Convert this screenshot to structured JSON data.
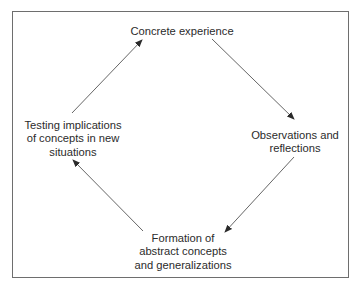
{
  "diagram": {
    "type": "cycle",
    "direction": "clockwise",
    "nodes": {
      "top": {
        "lines": [
          "Concrete experience"
        ]
      },
      "right": {
        "lines": [
          "Observations and",
          "reflections"
        ]
      },
      "bottom": {
        "lines": [
          "Formation of",
          "abstract concepts",
          "and generalizations"
        ]
      },
      "left": {
        "lines": [
          "Testing implications",
          "of concepts in new",
          "situations"
        ]
      }
    },
    "edges": [
      {
        "from": "top",
        "to": "right"
      },
      {
        "from": "right",
        "to": "bottom"
      },
      {
        "from": "bottom",
        "to": "left"
      },
      {
        "from": "left",
        "to": "top"
      }
    ],
    "colors": {
      "text": "#2b2b2b",
      "arrow": "#555555",
      "frame": "#6e6e6e",
      "background": "#ffffff"
    }
  }
}
